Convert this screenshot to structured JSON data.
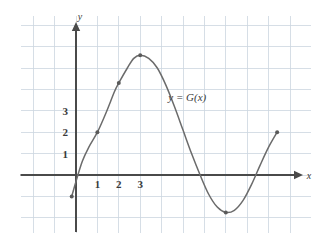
{
  "chart_data": {
    "type": "line",
    "title": "",
    "subtitle": "",
    "xlabel": "x",
    "ylabel": "y",
    "curve_label": "y = G(x)",
    "grid": true,
    "grid_spacing": 1,
    "legend_position": "inline-right",
    "xlim": [
      -2.6,
      11.2
    ],
    "ylim": [
      -3.0,
      6.6
    ],
    "x_ticks": [
      1,
      2,
      3
    ],
    "y_ticks": [
      1,
      2,
      3
    ],
    "x_tick_labels": [
      "1",
      "2",
      "3"
    ],
    "y_tick_labels": [
      "1",
      "2",
      "3"
    ],
    "series": [
      {
        "name": "G",
        "x": [
          -0.2,
          0.0,
          0.3,
          0.6,
          1.0,
          1.4,
          1.8,
          2.0,
          2.4,
          2.7,
          3.0,
          3.4,
          3.8,
          4.2,
          4.6,
          5.0,
          5.4,
          5.8,
          6.2,
          6.6,
          7.0,
          7.4,
          7.8,
          8.2,
          8.6,
          9.0,
          9.4
        ],
        "y": [
          -1.0,
          -0.3,
          0.65,
          1.3,
          2.0,
          2.9,
          3.9,
          4.3,
          5.0,
          5.45,
          5.6,
          5.45,
          5.0,
          4.2,
          3.2,
          2.1,
          1.0,
          0.0,
          -0.9,
          -1.5,
          -1.75,
          -1.65,
          -1.2,
          -0.45,
          0.45,
          1.3,
          2.0
        ]
      }
    ],
    "marked_points": [
      {
        "x": -0.2,
        "y": -1.0,
        "label": ""
      },
      {
        "x": 1.0,
        "y": 2.0,
        "label": ""
      },
      {
        "x": 2.0,
        "y": 4.3,
        "label": ""
      },
      {
        "x": 3.0,
        "y": 5.6,
        "label": ""
      },
      {
        "x": 7.0,
        "y": -1.75,
        "label": ""
      },
      {
        "x": 9.4,
        "y": 2.0,
        "label": ""
      }
    ],
    "colors": {
      "grid": "#ccd6e0",
      "grid_minor": "#dde4ec",
      "axis": "#4a4a4a",
      "curve": "#6b6b6b",
      "text": "#3a3a3a",
      "background": "#ffffff"
    },
    "curve_label_position": {
      "x": 5.2,
      "y": 3.45
    }
  }
}
